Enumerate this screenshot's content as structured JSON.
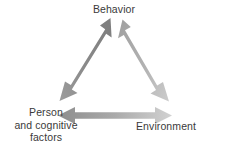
{
  "diagram": {
    "background_color": "#ffffff",
    "text_color": "#3a3a3a",
    "nodes": [
      {
        "id": "behavior",
        "label": "Behavior",
        "position": "top-center"
      },
      {
        "id": "person-cognitive-factors",
        "label": "Person\nand cognitive\nfactors",
        "position": "bottom-left"
      },
      {
        "id": "environment",
        "label": "Environment",
        "position": "bottom-right"
      }
    ],
    "connectors": [
      {
        "id": "behavior-person",
        "type": "double-headed-arrow",
        "from": "person-cognitive-factors",
        "to": "behavior",
        "orientation": "diagonal-left",
        "color_start": "#9a9a9a",
        "color_end": "#7e7e7e"
      },
      {
        "id": "behavior-environment",
        "type": "double-headed-arrow",
        "from": "behavior",
        "to": "environment",
        "orientation": "diagonal-right",
        "color_start": "#a2a2a2",
        "color_end": "#c9c9c9"
      },
      {
        "id": "person-environment",
        "type": "double-headed-arrow",
        "from": "person-cognitive-factors",
        "to": "environment",
        "orientation": "horizontal",
        "color_start": "#8f8f8f",
        "color_end": "#cfcfcf"
      }
    ]
  }
}
